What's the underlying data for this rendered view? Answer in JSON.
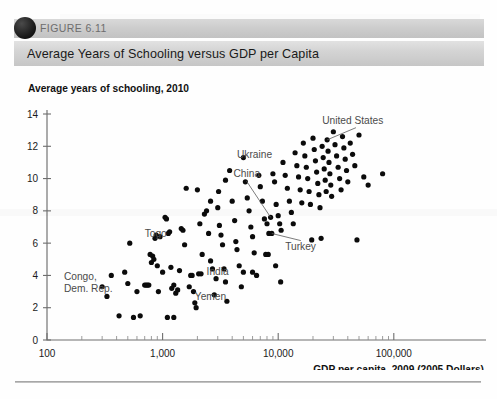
{
  "figure": {
    "number_label": "FIGURE 6.11",
    "title": "Average Years of Schooling versus GDP per Capita",
    "bullet_icon": "circle-bullet-icon"
  },
  "chart_data": {
    "type": "scatter",
    "title": "Average Years of Schooling versus GDP per Capita",
    "ylabel": "Average years of schooling, 2010",
    "xlabel": "GDP per capita, 2009 (2005 Dollars)",
    "xscale": "log",
    "xlim": [
      100,
      100000
    ],
    "ylim": [
      0,
      14
    ],
    "yticks": [
      0,
      2,
      4,
      6,
      8,
      10,
      12,
      14
    ],
    "ytick_labels": [
      "0",
      "2",
      "4",
      "6",
      "8",
      "10",
      "12",
      "14"
    ],
    "xticks": [
      100,
      1000,
      10000,
      100000
    ],
    "xtick_labels": [
      "100",
      "1,000",
      "10,000",
      "100,000"
    ],
    "x_minor_ticks": [
      200,
      300,
      400,
      500,
      600,
      700,
      800,
      900,
      2000,
      3000,
      4000,
      5000,
      6000,
      7000,
      8000,
      9000,
      20000,
      30000,
      40000,
      50000,
      60000,
      70000,
      80000,
      90000
    ],
    "grid": false,
    "legend": null,
    "marker": "filled-circle",
    "marker_color": "#0b0b0b",
    "marker_size": 2.6,
    "annotations": [
      {
        "label": "United States",
        "text_x": 24000,
        "text_y": 13.4,
        "leader_to_x": 26500,
        "leader_to_y": 12.4,
        "has_leader": true
      },
      {
        "label": "Ukraine",
        "text_x": 4400,
        "text_y": 11.3,
        "has_leader": false
      },
      {
        "label": "China",
        "text_x": 4100,
        "text_y": 10.1,
        "leader_to_x": 8600,
        "leader_to_y": 7.6,
        "has_leader": true
      },
      {
        "label": "Turkey",
        "text_x": 11500,
        "text_y": 5.6,
        "leader_to_x": 8800,
        "leader_to_y": 6.6,
        "has_leader": true
      },
      {
        "label": "Togo",
        "text_x": 700,
        "text_y": 6.4,
        "has_leader": false
      },
      {
        "label": "Congo, Dem. Rep.",
        "text_x": 140,
        "text_y": 3.7,
        "has_leader": false,
        "lines": [
          "Congo,",
          "Dem. Rep."
        ]
      },
      {
        "label": "India",
        "text_x": 2400,
        "text_y": 4.0,
        "has_leader": false
      },
      {
        "label": "Yemen",
        "text_x": 1900,
        "text_y": 2.5,
        "has_leader": false
      }
    ],
    "points": [
      [
        300,
        3.3
      ],
      [
        330,
        2.7
      ],
      [
        360,
        4.0
      ],
      [
        420,
        1.5
      ],
      [
        470,
        4.2
      ],
      [
        500,
        3.5
      ],
      [
        520,
        6.0
      ],
      [
        560,
        1.4
      ],
      [
        600,
        3.0
      ],
      [
        640,
        1.5
      ],
      [
        700,
        3.4
      ],
      [
        720,
        3.4
      ],
      [
        740,
        3.4
      ],
      [
        760,
        3.4
      ],
      [
        780,
        5.3
      ],
      [
        800,
        4.8
      ],
      [
        820,
        5.2
      ],
      [
        840,
        5.0
      ],
      [
        860,
        6.3
      ],
      [
        880,
        6.5
      ],
      [
        900,
        4.6
      ],
      [
        920,
        3.0
      ],
      [
        950,
        6.4
      ],
      [
        1000,
        4.2
      ],
      [
        1050,
        7.6
      ],
      [
        1080,
        7.5
      ],
      [
        1120,
        6.6
      ],
      [
        1150,
        6.7
      ],
      [
        1180,
        4.5
      ],
      [
        1200,
        3.2
      ],
      [
        1250,
        3.4
      ],
      [
        1300,
        2.9
      ],
      [
        1350,
        3.1
      ],
      [
        1400,
        4.3
      ],
      [
        1450,
        6.9
      ],
      [
        1500,
        6.8
      ],
      [
        1550,
        5.9
      ],
      [
        1600,
        9.4
      ],
      [
        1700,
        3.3
      ],
      [
        1750,
        4.0
      ],
      [
        1800,
        4.0
      ],
      [
        1850,
        3.0
      ],
      [
        1900,
        2.3
      ],
      [
        1950,
        2.0
      ],
      [
        2000,
        9.3
      ],
      [
        2100,
        7.2
      ],
      [
        2200,
        5.3
      ],
      [
        2300,
        7.8
      ],
      [
        2400,
        8.0
      ],
      [
        2500,
        6.6
      ],
      [
        2600,
        4.9
      ],
      [
        2700,
        4.4
      ],
      [
        2800,
        2.8
      ],
      [
        2900,
        3.8
      ],
      [
        3000,
        8.2
      ],
      [
        3100,
        7.1
      ],
      [
        3200,
        6.5
      ],
      [
        3300,
        5.9
      ],
      [
        3400,
        4.4
      ],
      [
        3500,
        3.6
      ],
      [
        3600,
        2.4
      ],
      [
        3800,
        10.5
      ],
      [
        4000,
        8.6
      ],
      [
        4200,
        7.4
      ],
      [
        4300,
        6.1
      ],
      [
        4400,
        5.6
      ],
      [
        4600,
        4.6
      ],
      [
        4800,
        3.3
      ],
      [
        5000,
        11.3
      ],
      [
        5200,
        9.8
      ],
      [
        5400,
        8.8
      ],
      [
        5600,
        8.0
      ],
      [
        5800,
        7.0
      ],
      [
        6000,
        6.4
      ],
      [
        6200,
        5.4
      ],
      [
        6500,
        4.0
      ],
      [
        6800,
        10.2
      ],
      [
        7000,
        9.5
      ],
      [
        7300,
        8.6
      ],
      [
        7600,
        7.5
      ],
      [
        8000,
        7.2
      ],
      [
        8300,
        6.6
      ],
      [
        8600,
        7.6
      ],
      [
        8800,
        6.6
      ],
      [
        9000,
        10.3
      ],
      [
        9300,
        9.8
      ],
      [
        9600,
        8.4
      ],
      [
        10000,
        7.7
      ],
      [
        10300,
        7.2
      ],
      [
        10600,
        6.8
      ],
      [
        11000,
        11.0
      ],
      [
        11500,
        10.2
      ],
      [
        12000,
        9.4
      ],
      [
        12500,
        8.6
      ],
      [
        13000,
        7.9
      ],
      [
        13500,
        7.2
      ],
      [
        14000,
        11.6
      ],
      [
        14500,
        10.8
      ],
      [
        15000,
        10.1
      ],
      [
        15500,
        9.3
      ],
      [
        16000,
        8.5
      ],
      [
        16500,
        12.2
      ],
      [
        17000,
        11.4
      ],
      [
        17500,
        10.7
      ],
      [
        18000,
        10.0
      ],
      [
        18500,
        9.2
      ],
      [
        19000,
        8.4
      ],
      [
        19500,
        6.2
      ],
      [
        20000,
        12.5
      ],
      [
        20500,
        11.8
      ],
      [
        21000,
        11.1
      ],
      [
        21500,
        10.4
      ],
      [
        22000,
        9.7
      ],
      [
        22500,
        9.0
      ],
      [
        23000,
        8.2
      ],
      [
        23500,
        6.3
      ],
      [
        24000,
        12.0
      ],
      [
        24500,
        11.3
      ],
      [
        25000,
        10.6
      ],
      [
        25500,
        9.9
      ],
      [
        26000,
        9.2
      ],
      [
        26500,
        12.4
      ],
      [
        27000,
        11.7
      ],
      [
        27500,
        11.0
      ],
      [
        28000,
        10.3
      ],
      [
        28500,
        9.6
      ],
      [
        29000,
        8.9
      ],
      [
        30000,
        12.9
      ],
      [
        31000,
        12.1
      ],
      [
        32000,
        11.4
      ],
      [
        33000,
        10.7
      ],
      [
        34000,
        10.0
      ],
      [
        35000,
        9.3
      ],
      [
        36000,
        12.6
      ],
      [
        37000,
        11.9
      ],
      [
        38000,
        11.2
      ],
      [
        39000,
        10.5
      ],
      [
        40000,
        9.8
      ],
      [
        42000,
        12.2
      ],
      [
        44000,
        11.5
      ],
      [
        46000,
        10.8
      ],
      [
        48000,
        6.2
      ],
      [
        50000,
        12.7
      ],
      [
        55000,
        10.1
      ],
      [
        60000,
        9.6
      ],
      [
        80000,
        10.3
      ],
      [
        1100,
        1.4
      ],
      [
        1250,
        1.4
      ],
      [
        5000,
        4.2
      ],
      [
        6000,
        4.2
      ],
      [
        2050,
        4.1
      ],
      [
        2150,
        4.1
      ],
      [
        2600,
        8.6
      ],
      [
        3050,
        9.2
      ],
      [
        3500,
        9.9
      ],
      [
        7800,
        5.3
      ],
      [
        8200,
        5.3
      ],
      [
        9500,
        4.6
      ],
      [
        10500,
        3.6
      ]
    ]
  }
}
